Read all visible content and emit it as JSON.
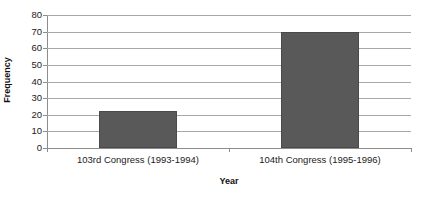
{
  "chart_data": {
    "type": "bar",
    "title": "",
    "subtitle": "",
    "xlabel": "Year",
    "ylabel": "Frequency",
    "categories": [
      "103rd Congress (1993-1994)",
      "104th Congress (1995-1996)"
    ],
    "values": [
      22,
      70
    ],
    "ylim": [
      0,
      80
    ],
    "yticks": [
      0,
      10,
      20,
      30,
      40,
      50,
      60,
      70,
      80
    ],
    "ytick_labels": [
      "0",
      "10",
      "20",
      "30",
      "40",
      "50",
      "60",
      "70",
      "80"
    ],
    "grid": true,
    "legend": false,
    "legend_position": "none",
    "series": [
      {
        "name": "Frequency",
        "values": [
          22,
          70
        ],
        "color": "#595959"
      }
    ],
    "colors": {
      "bar_fill": "#595959",
      "bar_border": "#4a4a4a",
      "gridline": "#a8a8a8",
      "axis": "#8d8d8d",
      "text": "#1a1a1a",
      "background": "#ffffff"
    }
  }
}
